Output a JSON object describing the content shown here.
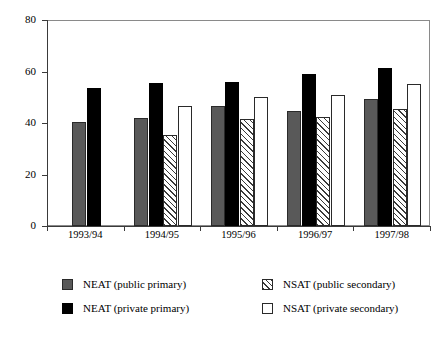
{
  "chart_data": {
    "type": "bar",
    "title": "",
    "xlabel": "",
    "ylabel": "",
    "ylim": [
      0,
      80
    ],
    "yticks": [
      0,
      20,
      40,
      60,
      80
    ],
    "grid": false,
    "legend_position": "bottom",
    "categories": [
      "1993/94",
      "1994/95",
      "1995/96",
      "1996/97",
      "1997/98"
    ],
    "series": [
      {
        "name": "NEAT (public primary)",
        "style": "s-gray",
        "color": "#595959",
        "values": [
          40.5,
          42.0,
          46.5,
          44.5,
          49.5
        ]
      },
      {
        "name": "NEAT (private primary)",
        "style": "s-black",
        "color": "#000000",
        "values": [
          53.5,
          55.5,
          56.0,
          59.0,
          61.5
        ]
      },
      {
        "name": "NSAT (public secondary)",
        "style": "s-hatch",
        "color": "#ffffff",
        "values": [
          null,
          35.5,
          41.5,
          42.5,
          45.5
        ]
      },
      {
        "name": "NSAT (private secondary)",
        "style": "s-white",
        "color": "#ffffff",
        "values": [
          null,
          46.5,
          50.0,
          51.0,
          55.0
        ]
      }
    ]
  },
  "axis": {
    "y_tick_labels": [
      "80",
      "60",
      "40",
      "20",
      "0"
    ],
    "x_tick_labels": [
      "1993/94",
      "1994/95",
      "1995/96",
      "1996/97",
      "1997/98"
    ]
  },
  "legend": {
    "entries": [
      {
        "label": "NEAT (public primary)",
        "style": "s-gray"
      },
      {
        "label": "NSAT (public secondary)",
        "style": "s-hatch"
      },
      {
        "label": "NEAT (private primary)",
        "style": "s-black"
      },
      {
        "label": "NSAT (private secondary)",
        "style": "s-white"
      }
    ]
  },
  "colors": {
    "public_primary": "#595959",
    "private_primary": "#000000",
    "public_secondary": "#ffffff",
    "private_secondary": "#ffffff",
    "axis": "#3a3a3a",
    "frame": "#8a8a8a",
    "background": "#ffffff"
  }
}
